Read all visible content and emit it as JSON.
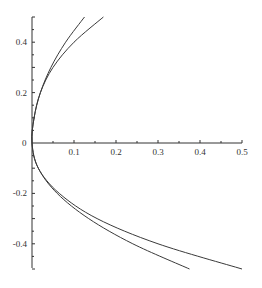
{
  "chart_data": {
    "type": "line",
    "title": "",
    "xlabel": "",
    "ylabel": "",
    "xlim": [
      0,
      0.5
    ],
    "ylim": [
      -0.5,
      0.5
    ],
    "grid": false,
    "legend": null,
    "x_ticks": [
      "0.1",
      "0.2",
      "0.3",
      "0.4",
      "0.5"
    ],
    "x_tick_values": [
      0.1,
      0.2,
      0.3,
      0.4,
      0.5
    ],
    "y_ticks": [
      "0.4",
      "0.2",
      "0",
      "-0.2",
      "-0.4"
    ],
    "y_tick_values": [
      0.4,
      0.2,
      0,
      -0.2,
      -0.4
    ],
    "series": [
      {
        "name": "curve-1",
        "color": "#3a3a3a",
        "points": [
          [
            0.125,
            0.5
          ],
          [
            0.08,
            0.4
          ],
          [
            0.045,
            0.3
          ],
          [
            0.02,
            0.2
          ],
          [
            0.005,
            0.1
          ],
          [
            0,
            0
          ],
          [
            0.015,
            -0.1
          ],
          [
            0.06,
            -0.2
          ],
          [
            0.135,
            -0.3
          ],
          [
            0.24,
            -0.4
          ],
          [
            0.375,
            -0.5
          ]
        ]
      },
      {
        "name": "curve-2",
        "color": "#3a3a3a",
        "points": [
          [
            0.17,
            0.5
          ],
          [
            0.1,
            0.4
          ],
          [
            0.05,
            0.3
          ],
          [
            0.02,
            0.2
          ],
          [
            0.005,
            0.1
          ],
          [
            0,
            0
          ],
          [
            0.015,
            -0.1
          ],
          [
            0.065,
            -0.2
          ],
          [
            0.155,
            -0.3
          ],
          [
            0.3,
            -0.4
          ],
          [
            0.5,
            -0.5
          ]
        ]
      }
    ]
  },
  "axes": {
    "origin_label": "0",
    "color": "#333333"
  }
}
